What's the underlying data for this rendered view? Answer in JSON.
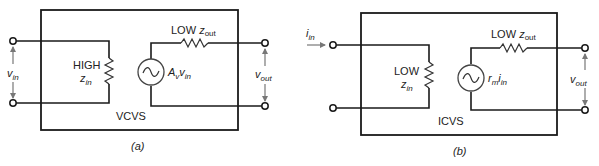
{
  "diagrams": [
    {
      "id": "a",
      "caption": "(a)",
      "type_label": "VCVS",
      "input_label": {
        "var": "v",
        "sub": "in"
      },
      "input_impedance": {
        "level": "HIGH",
        "var": "z",
        "sub": "in"
      },
      "source_label": {
        "coef": "A",
        "coef_sub": "v",
        "var": "v",
        "sub": "in"
      },
      "output_impedance": {
        "level": "LOW",
        "var": "z",
        "sub": "out"
      },
      "output_label": {
        "var": "v",
        "sub": "out"
      }
    },
    {
      "id": "b",
      "caption": "(b)",
      "type_label": "ICVS",
      "input_label": {
        "var": "i",
        "sub": "in"
      },
      "input_impedance": {
        "level": "LOW",
        "var": "z",
        "sub": "in"
      },
      "source_label": {
        "coef": "r",
        "coef_sub": "m",
        "var": "i",
        "sub": "in"
      },
      "output_impedance": {
        "level": "LOW",
        "var": "z",
        "sub": "out"
      },
      "output_label": {
        "var": "v",
        "sub": "out"
      }
    }
  ],
  "colors": {
    "line": "#1a1a1a",
    "arrow": "#777777",
    "background": "#ffffff"
  }
}
